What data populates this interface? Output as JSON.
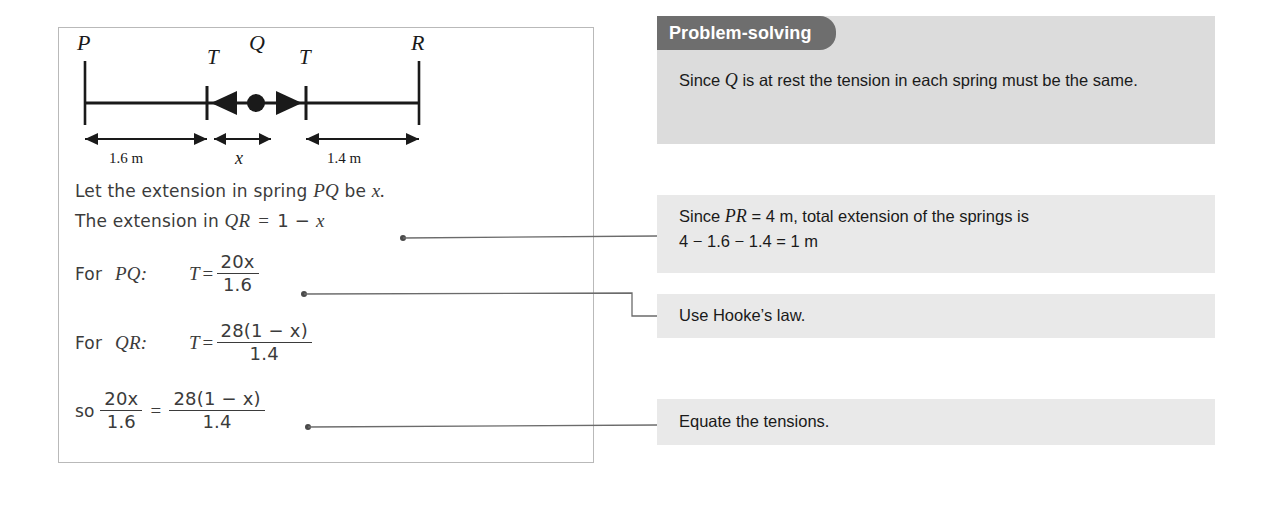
{
  "solution": {
    "diagram": {
      "point_labels": {
        "left": "P",
        "middle": "Q",
        "right": "R"
      },
      "tension_left": "T",
      "tension_right": "T",
      "dim_left": "1.6 m",
      "dim_middle": "x",
      "dim_right": "1.4 m"
    },
    "lines": {
      "let_extension_pre": "Let the extension in spring ",
      "let_extension_pq": "PQ",
      "let_extension_post": " be ",
      "let_extension_x": "x.",
      "ext_qr_pre": "The extension in ",
      "ext_qr_var": "QR",
      "ext_qr_eq": " = ",
      "ext_qr_val": "1 − ",
      "ext_qr_x": "x",
      "for_pq_label": "For",
      "for_pq_pair": "PQ:",
      "for_pq_t": "T",
      "for_pq_eq": "=",
      "for_pq_num": "20x",
      "for_pq_den": "1.6",
      "for_qr_label": "For",
      "for_qr_pair": "QR:",
      "for_qr_t": "T",
      "for_qr_eq": "=",
      "for_qr_num": "28(1 − x)",
      "for_qr_den": "1.4",
      "so_label": "so",
      "so_lhs_num": "20x",
      "so_lhs_den": "1.6",
      "so_eq": "=",
      "so_rhs_num": "28(1 − x)",
      "so_rhs_den": "1.4"
    }
  },
  "hints": {
    "problem_solving_tab": "Problem-solving",
    "problem_solving_pre": "Since ",
    "problem_solving_var": "Q",
    "problem_solving_post": " is at rest the tension in each spring must be the same.",
    "pr_total_pre": "Since ",
    "pr_total_var": "PR",
    "pr_total_post": " = 4 m, total extension of the springs is",
    "pr_total_line2": "4 − 1.6 − 1.4 = 1 m",
    "hookes_law": "Use Hooke’s law.",
    "equate_tensions": "Equate the tensions."
  },
  "colors": {
    "tab_background": "#6e6e6e",
    "hint_background": "#e9e9e9",
    "problem_solving_background": "#dcdcdc",
    "panel_border": "#b9b9b9",
    "ink": "#3b3b3b",
    "diagram_stroke": "#1a1a1a"
  }
}
